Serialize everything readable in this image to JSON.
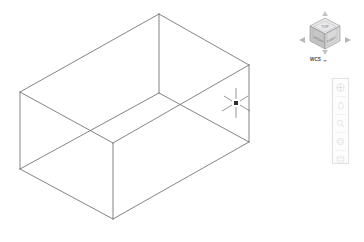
{
  "app": {
    "name": "cad-3d-modeling-viewport",
    "background_color": "#ffffff",
    "geometry_line_color": "#6e6e72"
  },
  "viewport": {
    "name": "model-space-viewport",
    "projection": "isometric",
    "visual_style": "2D Wireframe"
  },
  "model": {
    "type": "box-wireframe",
    "description": "Rectangular box drawn as isometric wireframe",
    "vertices": {
      "top_back": [
        159,
        14
      ],
      "top_left": [
        20,
        92
      ],
      "top_right": [
        249,
        65
      ],
      "top_front": [
        113,
        143
      ],
      "bottom_left": [
        20,
        169
      ],
      "bottom_right": [
        249,
        142
      ],
      "bottom_front": [
        113,
        219
      ],
      "inner_center": [
        159,
        93
      ]
    },
    "edges": [
      [
        "top_back",
        "top_left"
      ],
      [
        "top_back",
        "top_right"
      ],
      [
        "top_left",
        "top_front"
      ],
      [
        "top_right",
        "top_front"
      ],
      [
        "top_left",
        "bottom_left"
      ],
      [
        "top_right",
        "bottom_right"
      ],
      [
        "top_front",
        "bottom_front"
      ],
      [
        "bottom_left",
        "bottom_front"
      ],
      [
        "bottom_right",
        "bottom_front"
      ],
      [
        "top_back",
        "inner_center"
      ],
      [
        "inner_center",
        "top_left"
      ],
      [
        "inner_center",
        "top_right"
      ]
    ]
  },
  "cursor": {
    "name": "isometric-crosshair-cursor",
    "x": 236,
    "y": 103,
    "pickbox_size": 4,
    "crosshair_length": 14,
    "color": "#4a4a4a"
  },
  "viewcube": {
    "name": "viewcube-widget",
    "faces": {
      "top_label": "TOP",
      "front_label": "FRONT",
      "right_label": "RIGHT"
    },
    "face_colors": {
      "top": "#e8e8e8",
      "front": "#c9c9c9",
      "right": "#d8d8d8",
      "edge": "#9a9a9a"
    },
    "compass_arrows": [
      "arrow-left",
      "arrow-right",
      "arrow-up",
      "arrow-down"
    ],
    "coordinate_system": {
      "label": "WCS",
      "dropdown": true
    }
  },
  "navbar": {
    "name": "navigation-bar",
    "orientation": "vertical",
    "buttons": [
      {
        "name": "steering-wheels-button",
        "icon": "wheel-icon"
      },
      {
        "name": "pan-button",
        "icon": "hand-icon"
      },
      {
        "name": "zoom-button",
        "icon": "magnifier-icon"
      },
      {
        "name": "orbit-button",
        "icon": "orbit-icon"
      },
      {
        "name": "showmotion-button",
        "icon": "film-icon"
      }
    ]
  }
}
